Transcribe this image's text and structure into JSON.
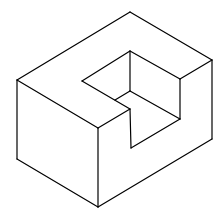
{
  "figure": {
    "stroke_color": "#000000",
    "background": "#ffffff",
    "edges": [
      {
        "name": "top-left-edge",
        "points": [
          [
            17,
            80
          ],
          [
            130,
            12
          ]
        ]
      },
      {
        "name": "top-right-edge",
        "points": [
          [
            130,
            12
          ],
          [
            212,
            60
          ]
        ]
      },
      {
        "name": "left-vertical-edge",
        "points": [
          [
            17,
            80
          ],
          [
            17,
            159
          ]
        ]
      },
      {
        "name": "left-bottom-edge",
        "points": [
          [
            17,
            159
          ],
          [
            98,
            207
          ]
        ]
      },
      {
        "name": "front-bottom-edge",
        "points": [
          [
            98,
            207
          ],
          [
            212,
            139
          ]
        ]
      },
      {
        "name": "right-vertical-edge",
        "points": [
          [
            212,
            60
          ],
          [
            212,
            139
          ]
        ]
      },
      {
        "name": "top-front-edge",
        "points": [
          [
            17,
            80
          ],
          [
            98,
            128
          ]
        ]
      },
      {
        "name": "front-vertical-edge",
        "points": [
          [
            98,
            128
          ],
          [
            98,
            207
          ]
        ]
      },
      {
        "name": "front-top-to-notch",
        "points": [
          [
            98,
            128
          ],
          [
            130,
            109
          ]
        ]
      },
      {
        "name": "right-top-to-notch",
        "points": [
          [
            212,
            60
          ],
          [
            180,
            79
          ]
        ]
      },
      {
        "name": "notch-top-left",
        "points": [
          [
            82,
            81
          ],
          [
            130,
            51
          ]
        ]
      },
      {
        "name": "notch-top-right",
        "points": [
          [
            130,
            51
          ],
          [
            180,
            79
          ]
        ]
      },
      {
        "name": "notch-back-vertical",
        "points": [
          [
            130,
            51
          ],
          [
            130,
            91
          ]
        ]
      },
      {
        "name": "notch-right-vertical",
        "points": [
          [
            180,
            79
          ],
          [
            180,
            119
          ]
        ]
      },
      {
        "name": "notch-left-lip",
        "points": [
          [
            82,
            81
          ],
          [
            130,
            109
          ]
        ]
      },
      {
        "name": "notch-step-top",
        "points": [
          [
            115,
            100
          ],
          [
            130,
            91
          ]
        ]
      },
      {
        "name": "notch-floor-diagonal",
        "points": [
          [
            130,
            91
          ],
          [
            180,
            119
          ]
        ]
      },
      {
        "name": "notch-inner-vertical",
        "points": [
          [
            130,
            109
          ],
          [
            131,
            148
          ]
        ]
      },
      {
        "name": "notch-bottom-edge",
        "points": [
          [
            131,
            148
          ],
          [
            180,
            119
          ]
        ]
      }
    ]
  }
}
